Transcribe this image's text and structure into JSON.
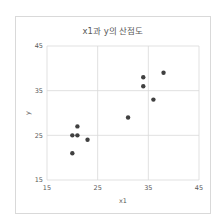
{
  "chart_data": {
    "type": "scatter",
    "title": "x1과 y의 산점도",
    "xlabel": "x1",
    "ylabel": "y",
    "xlim": [
      15,
      45
    ],
    "ylim": [
      15,
      45
    ],
    "xticks": [
      15,
      25,
      35,
      45
    ],
    "yticks": [
      15,
      25,
      35,
      45
    ],
    "grid": true,
    "legend": null,
    "series": [
      {
        "name": "y",
        "color": "#404040",
        "points": [
          {
            "x": 20,
            "y": 21
          },
          {
            "x": 20,
            "y": 25
          },
          {
            "x": 21,
            "y": 25
          },
          {
            "x": 21,
            "y": 27
          },
          {
            "x": 23,
            "y": 24
          },
          {
            "x": 31,
            "y": 29
          },
          {
            "x": 34,
            "y": 36
          },
          {
            "x": 34,
            "y": 38
          },
          {
            "x": 36,
            "y": 33
          },
          {
            "x": 38,
            "y": 39
          }
        ]
      }
    ]
  },
  "colors": {
    "grid": "#d9d9d9",
    "marker": "#404040",
    "text": "#595959",
    "frame": "#d9d9d9"
  }
}
